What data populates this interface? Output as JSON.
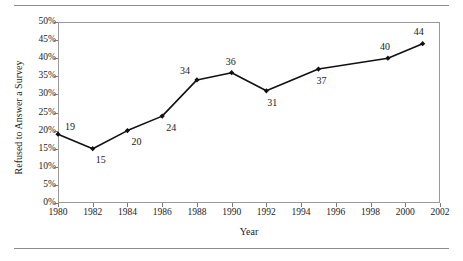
{
  "chart_data": {
    "type": "line",
    "title": "",
    "xlabel": "Year",
    "ylabel": "Refused to Answer a Survey",
    "x": [
      1980,
      1982,
      1984,
      1986,
      1988,
      1990,
      1992,
      1995,
      1999,
      2001
    ],
    "values": [
      19,
      15,
      20,
      24,
      34,
      36,
      31,
      37,
      40,
      44
    ],
    "point_labels": [
      "19",
      "15",
      "20",
      "24",
      "34",
      "36",
      "31",
      "37",
      "40",
      "44"
    ],
    "xlim": [
      1980,
      2002
    ],
    "ylim": [
      0,
      50
    ],
    "x_tick_labels": [
      "1980",
      "1982",
      "1984",
      "1986",
      "1988",
      "1990",
      "1992",
      "1994",
      "1996",
      "1998",
      "2000",
      "2002"
    ],
    "x_tick_values": [
      1980,
      1982,
      1984,
      1986,
      1988,
      1990,
      1992,
      1994,
      1996,
      1998,
      2000,
      2002
    ],
    "y_tick_labels": [
      "0%",
      "5%",
      "10%",
      "15%",
      "20%",
      "25%",
      "30%",
      "35%",
      "40%",
      "45%",
      "50%"
    ],
    "y_tick_values": [
      0,
      5,
      10,
      15,
      20,
      25,
      30,
      35,
      40,
      45,
      50
    ],
    "grid": false,
    "legend": null,
    "series_color": "#111111",
    "marker": "diamond",
    "label_offsets": [
      {
        "dx": 12,
        "dy": -7
      },
      {
        "dx": 8,
        "dy": 11
      },
      {
        "dx": 9,
        "dy": 11
      },
      {
        "dx": 9,
        "dy": 12
      },
      {
        "dx": -12,
        "dy": -9
      },
      {
        "dx": -1,
        "dy": -11
      },
      {
        "dx": 6,
        "dy": 12
      },
      {
        "dx": 3,
        "dy": 12
      },
      {
        "dx": -3,
        "dy": -11
      },
      {
        "dx": -4,
        "dy": -12
      }
    ]
  },
  "figure": {
    "rule_color": "#8d8d8d",
    "frame_color": "#9a9a9a",
    "background": "#ffffff"
  }
}
